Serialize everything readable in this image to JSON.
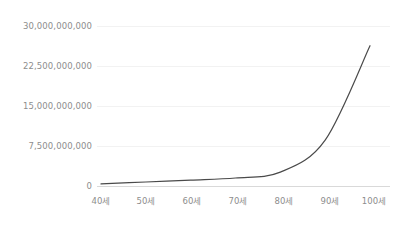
{
  "chart_data": {
    "type": "line",
    "title": "",
    "subtitle": "",
    "xlabel": "",
    "ylabel": "",
    "x": [
      "40세",
      "50세",
      "60세",
      "70세",
      "80세",
      "90세",
      "100세"
    ],
    "categories": [
      "40세",
      "50세",
      "60세",
      "70세",
      "80세",
      "90세",
      "100세"
    ],
    "values": [
      400000000,
      750000000,
      1100000000,
      1500000000,
      2600000000,
      8600000000,
      26300000000
    ],
    "series": [
      {
        "name": "",
        "color": "#4a4a4a",
        "values": [
          400000000,
          750000000,
          1100000000,
          1500000000,
          2600000000,
          8600000000,
          26300000000
        ]
      }
    ],
    "ylim": [
      0,
      30000000000
    ],
    "y_ticks": [
      0,
      7500000000,
      15000000000,
      22500000000,
      30000000000
    ],
    "y_tick_labels": [
      "0",
      "7,500,000,000",
      "15,000,000,000",
      "22,500,000,000",
      "30,000,000,000"
    ],
    "x_tick_labels": [
      "40세",
      "50세",
      "60세",
      "70세",
      "80세",
      "90세",
      "100세"
    ],
    "grid": true,
    "grid_axis": "y",
    "legend": false,
    "legend_position": "none",
    "annotations": []
  },
  "axes": {
    "y": {
      "ticks": [
        {
          "label": "30,000,000,000",
          "value": 30000000000
        },
        {
          "label": "22,500,000,000",
          "value": 22500000000
        },
        {
          "label": "15,000,000,000",
          "value": 15000000000
        },
        {
          "label": "7,500,000,000",
          "value": 7500000000
        },
        {
          "label": "0",
          "value": 0
        }
      ]
    },
    "x": {
      "ticks": [
        {
          "label": "40세",
          "value": 40
        },
        {
          "label": "50세",
          "value": 50
        },
        {
          "label": "60세",
          "value": 60
        },
        {
          "label": "70세",
          "value": 70
        },
        {
          "label": "80세",
          "value": 80
        },
        {
          "label": "90세",
          "value": 90
        },
        {
          "label": "100세",
          "value": 100
        }
      ]
    }
  },
  "colors": {
    "background": "#ffffff",
    "line": "#4a4a4a",
    "gridline": "#f2f2f2",
    "axis": "#d9d9d9",
    "tick_text": "#8d8d8d"
  }
}
